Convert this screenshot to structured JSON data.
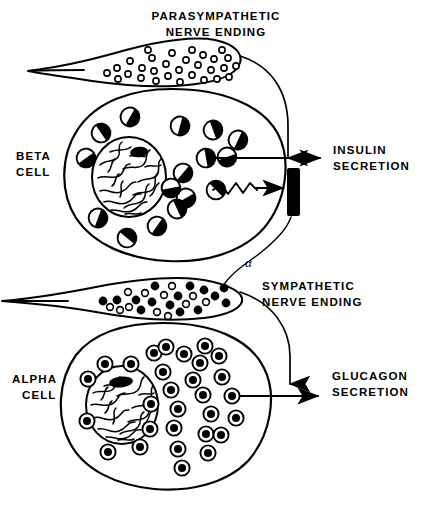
{
  "figure": {
    "background_color": "#ffffff",
    "ink_color": "#000000",
    "width": 432,
    "height": 513
  },
  "labels": {
    "parasympathetic_line1": "PARASYMPATHETIC",
    "parasympathetic_line2": "NERVE  ENDING",
    "sympathetic_line1": "SYMPATHETIC",
    "sympathetic_line2": "NERVE  ENDING",
    "beta_cell_line1": "BETA",
    "beta_cell_line2": "CELL",
    "alpha_cell_line1": "ALPHA",
    "alpha_cell_line2": "CELL",
    "insulin_line1": "INSULIN",
    "insulin_line2": "SECRETION",
    "glucagon_line1": "GLUCAGON",
    "glucagon_line2": "SECRETION",
    "alpha_receptor": "α"
  },
  "structures": [
    {
      "name": "parasympathetic-nerve-ending",
      "shape": "tapered-teardrop",
      "granule_style": "small-hollow-circles",
      "granule_count": 30
    },
    {
      "name": "beta-cell",
      "shape": "rounded-ellipse",
      "granule_style": "half-filled-circles",
      "granule_count": 16,
      "has_nucleus": true
    },
    {
      "name": "sympathetic-nerve-ending",
      "shape": "tapered-lens",
      "granule_style": "mixed-solid-and-hollow-circles",
      "granule_count": 27
    },
    {
      "name": "alpha-cell",
      "shape": "rounded-ellipse",
      "granule_style": "concentric-ringed-circles",
      "granule_count": 29,
      "has_nucleus": true
    }
  ],
  "connectors": [
    {
      "name": "parasympathetic-to-beta-arrow",
      "type": "curved-arrow",
      "direction": "down"
    },
    {
      "name": "sympathetic-to-alpha-arrow",
      "type": "curved-arrow",
      "direction": "down"
    },
    {
      "name": "insulin-output-arrow",
      "type": "straight-arrow",
      "direction": "right"
    },
    {
      "name": "glucagon-output-arrow",
      "type": "straight-arrow",
      "direction": "right"
    },
    {
      "name": "alpha-receptor-inhibition-arrow",
      "type": "straight-arrow",
      "direction": "right"
    },
    {
      "name": "zigzag-signal",
      "type": "zigzag"
    },
    {
      "name": "alpha-receptor-bar",
      "type": "filled-rectangle"
    }
  ]
}
